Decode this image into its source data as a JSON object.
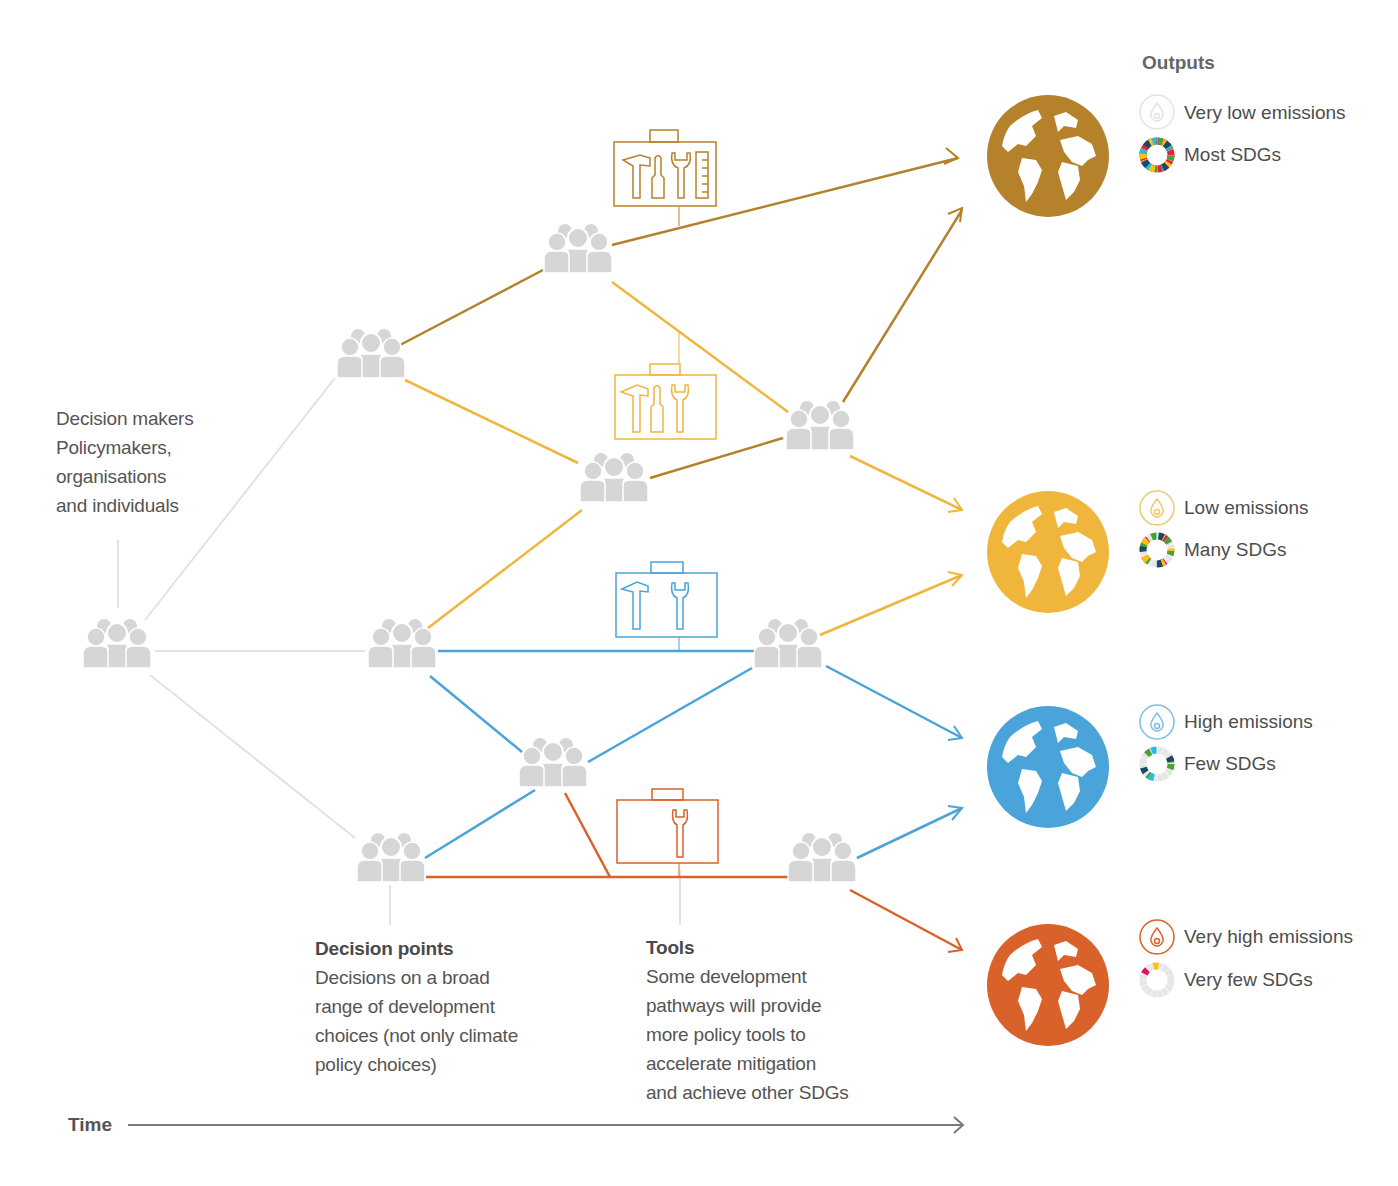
{
  "legend": {
    "title": "Outputs",
    "items": [
      {
        "emissions": "Very low emissions",
        "sdgs": "Most SDGs",
        "color": "#b5812a",
        "drop_color": "#e6e6e6"
      },
      {
        "emissions": "Low emissions",
        "sdgs": "Many SDGs",
        "color": "#f0b63c",
        "drop_color": "#f0c86e"
      },
      {
        "emissions": "High emissions",
        "sdgs": "Few SDGs",
        "color": "#4aa3d9",
        "drop_color": "#7cbfe6"
      },
      {
        "emissions": "Very high emissions",
        "sdgs": "Very few SDGs",
        "color": "#d9622b",
        "drop_color": "#d9622b"
      }
    ]
  },
  "annotations": {
    "decision_makers": {
      "lines": [
        "Decision makers",
        "Policymakers,",
        "organisations",
        "and individuals"
      ]
    },
    "decision_points": {
      "heading": "Decision points",
      "lines": [
        "Decisions on a broad",
        "range of development",
        "choices (not only climate",
        "policy choices)"
      ]
    },
    "tools": {
      "heading": "Tools",
      "lines": [
        "Some development",
        "pathways will provide",
        "more policy tools to",
        "accelerate mitigation",
        "and achieve other SDGs"
      ]
    }
  },
  "axis": {
    "time_label": "Time"
  },
  "colors": {
    "very_low": "#b5812a",
    "low": "#f0b63c",
    "high": "#4aa3d9",
    "very_high": "#d9622b",
    "neutral_line": "#e2e2e2",
    "people": "#d6d6d6",
    "time_arrow": "#7a7a7a"
  },
  "toolboxes": [
    {
      "pathway": "very_low",
      "tools": [
        "hammer",
        "screwdriver",
        "wrench",
        "ruler"
      ]
    },
    {
      "pathway": "low",
      "tools": [
        "hammer",
        "screwdriver",
        "wrench"
      ]
    },
    {
      "pathway": "high",
      "tools": [
        "hammer",
        "wrench"
      ]
    },
    {
      "pathway": "very_high",
      "tools": [
        "wrench"
      ]
    }
  ]
}
